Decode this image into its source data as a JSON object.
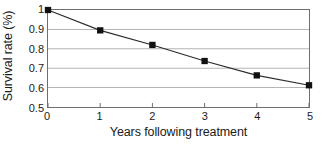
{
  "chart_data": {
    "type": "line",
    "title": "",
    "xlabel": "Years following treatment",
    "ylabel": "Survival rate (%)",
    "x": [
      0,
      1,
      2,
      3,
      4,
      5
    ],
    "values": [
      1,
      0.895,
      0.82,
      0.737,
      0.663,
      0.612
    ],
    "series": [
      {
        "name": "Survival rate",
        "values": [
          1,
          0.895,
          0.82,
          0.737,
          0.663,
          0.612
        ]
      }
    ],
    "xlim": [
      0,
      5
    ],
    "ylim": [
      0.5,
      1
    ],
    "xticks": [
      "0",
      "1",
      "2",
      "3",
      "4",
      "5"
    ],
    "yticks": [
      "1",
      "0.9",
      "0.8",
      "0.7",
      "0.6",
      "0.5"
    ],
    "ytick_values": [
      1,
      0.9,
      0.8,
      0.7,
      0.6,
      0.5
    ],
    "grid": "horizontal",
    "legend": "none",
    "marker": "filled-square",
    "colors": {
      "line": "#2b2b2b",
      "marker": "#111111",
      "grid": "#b5b5b5",
      "axis": "#6e6e6e",
      "text": "#1a1a1a",
      "background": "#ffffff"
    }
  }
}
